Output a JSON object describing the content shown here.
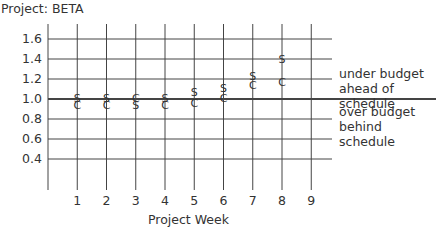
{
  "chart_data": {
    "type": "scatter",
    "title": "Project: BETA",
    "xlabel": "Project Week",
    "ylabel": "",
    "x": [
      1,
      2,
      3,
      4,
      5,
      6,
      7,
      8
    ],
    "x_ticks": [
      "1",
      "2",
      "3",
      "4",
      "5",
      "6",
      "7",
      "8",
      "9"
    ],
    "y_ticks": [
      "1.6",
      "1.4",
      "1.2",
      "1.0",
      "0.8",
      "0.6",
      "0.4"
    ],
    "ylim": [
      0.2,
      1.7
    ],
    "xlim": [
      0,
      9
    ],
    "grid": true,
    "series": [
      {
        "name": "S",
        "marker": "S",
        "values": [
          1.0,
          1.0,
          0.93,
          1.0,
          1.06,
          1.1,
          1.22,
          1.39
        ]
      },
      {
        "name": "C",
        "marker": "C",
        "values": [
          0.93,
          0.93,
          1.0,
          0.93,
          0.95,
          1.0,
          1.13,
          1.16
        ]
      }
    ],
    "reference_line": {
      "y": 1.0,
      "style": "bold"
    },
    "annotations": [
      {
        "text_lines": [
          "under budget",
          "ahead of schedule"
        ],
        "region": "above 1.0"
      },
      {
        "text_lines": [
          "over budget",
          "behind schedule"
        ],
        "region": "below 1.0"
      }
    ]
  },
  "labels": {
    "title": "Project: BETA",
    "xtitle": "Project Week",
    "above_line1": "under budget",
    "above_line2": "ahead of schedule",
    "below_line1": "over budget",
    "below_line2": "behind schedule"
  }
}
